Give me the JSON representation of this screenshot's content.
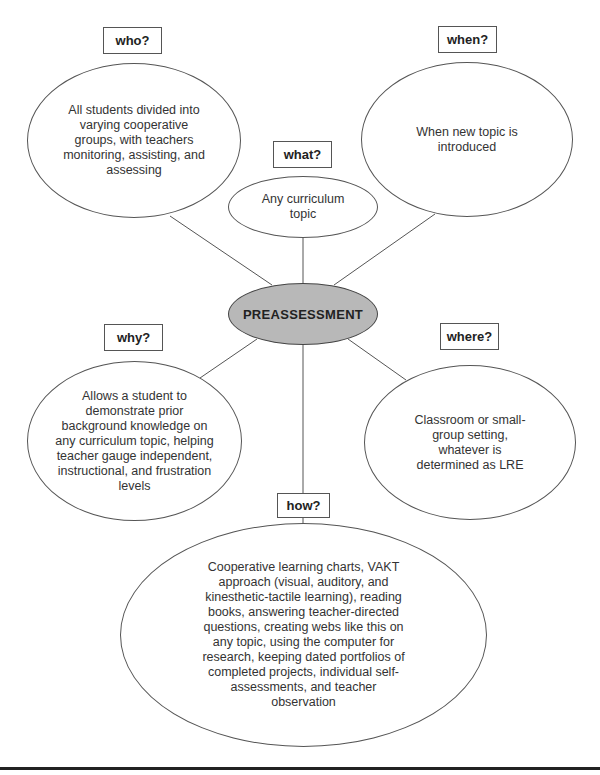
{
  "diagram": {
    "center": {
      "label": "PREASSESSMENT",
      "fill": "#b8b8b8"
    },
    "nodes": {
      "who": {
        "question": "who?",
        "text": "All students divided into varying cooperative groups, with teachers monitoring, assisting, and assessing"
      },
      "when": {
        "question": "when?",
        "text": "When new topic is introduced"
      },
      "what": {
        "question": "what?",
        "text": "Any curriculum topic"
      },
      "why": {
        "question": "why?",
        "text": "Allows a student to demonstrate prior background knowledge on any curriculum topic, helping teacher gauge independent, instructional, and frustration levels"
      },
      "where": {
        "question": "where?",
        "text": "Classroom or small-group setting, whatever is determined as LRE"
      },
      "how": {
        "question": "how?",
        "text": "Cooperative learning charts, VAKT approach (visual, auditory, and kinesthetic-tactile learning), reading books, answering teacher-directed questions, creating webs like this on any topic, using the computer for research, keeping dated portfolios of completed projects, individual self-assessments, and teacher observation"
      }
    }
  }
}
